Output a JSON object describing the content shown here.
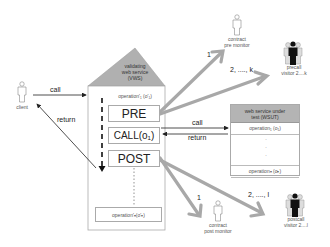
{
  "diagram": {
    "colors": {
      "roof": "#b0b0b0",
      "wsut_header": "#b4b4b4",
      "big_arrow": "#a8a8a8",
      "line": "#222222"
    },
    "client": {
      "label": "client",
      "icon": "person-outline-icon"
    },
    "client_call": {
      "label": "call"
    },
    "client_return": {
      "label": "return"
    },
    "vws": {
      "title_line1": "validating",
      "title_line2": "web service",
      "title_line3": "(VWS)",
      "operation_first": "operation'₁ (o'₁)",
      "pre": "PRE",
      "call": "CALL(o₁)",
      "post": "POST",
      "operation_last": "operation'ₙ(o'ₙ)"
    },
    "wsut": {
      "title_line1": "web service under",
      "title_line2": "test  (WSUT)",
      "operation_first": "operation₁ (o₁)",
      "dots": [
        "·",
        "·",
        "·"
      ],
      "operation_last": "operationₙ (oₙ)"
    },
    "wsut_call": {
      "label": "call"
    },
    "wsut_return": {
      "label": "return"
    },
    "pre_monitor": {
      "line1": "contract",
      "line2": "pre monitor",
      "arrow_label": "1",
      "icon": "person-outline-icon"
    },
    "precall_visitors": {
      "line1": "precall",
      "line2": "visitor 2....k",
      "arrow_label": "2, ...., k",
      "icon": "person-group-icon"
    },
    "post_monitor": {
      "line1": "contract",
      "line2": "post monitor",
      "arrow_label": "1",
      "icon": "person-outline-icon"
    },
    "postcall_visitors": {
      "line1": "postcall",
      "line2": "visitor 2....l",
      "arrow_label": "2, ...., l",
      "icon": "person-group-icon"
    }
  }
}
